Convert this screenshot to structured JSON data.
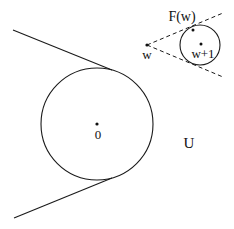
{
  "diagram": {
    "labels": {
      "origin": "0",
      "w": "w",
      "w_plus_1": "w+1",
      "f_of_w": "F(w)",
      "region_u": "U"
    },
    "elements": {
      "large_circle": {
        "center": "0",
        "description": "circle centered at origin with two tangent lines from the left"
      },
      "small_circle": {
        "center": "w+1",
        "description": "circle centered at w+1 inside dashed cone from w"
      },
      "cone_from_w": {
        "style": "dashed",
        "apex": "w",
        "label": "F(w)"
      },
      "tangent_lines": {
        "style": "solid",
        "count": 2
      }
    },
    "colors": {
      "stroke": "#1a1a1a",
      "background": "#ffffff"
    }
  }
}
